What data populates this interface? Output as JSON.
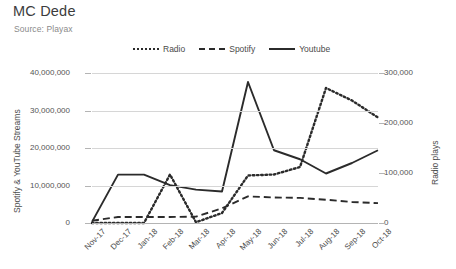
{
  "header": {
    "title": "MC Dede",
    "subtitle": "Source: Playax"
  },
  "chart_data": {
    "type": "line",
    "title": "MC Dede",
    "subtitle": "Source: Playax",
    "xlabel": "",
    "ylabel": "Spotify & YouTube Streams",
    "y2label": "Radio plays",
    "grid": true,
    "legend_position": "top-center",
    "categories": [
      "Nov-17",
      "Dec-17",
      "Jan-18",
      "Feb-18",
      "Mar-18",
      "Apr-18",
      "May-18",
      "Jun-18",
      "Jul-18",
      "Aug-18",
      "Sep-18",
      "Oct-18"
    ],
    "ylim": [
      0,
      40000000
    ],
    "yticks": [
      "0",
      "10,000,000",
      "20,000,000",
      "30,000,000",
      "40,000,000"
    ],
    "ytick_values": [
      0,
      10000000,
      20000000,
      30000000,
      40000000
    ],
    "y2lim": [
      0,
      300000
    ],
    "y2ticks": [
      "0",
      "100,000",
      "200,000",
      "300,000"
    ],
    "y2tick_values": [
      0,
      100000,
      200000,
      300000
    ],
    "series": [
      {
        "name": "Radio",
        "axis": "right",
        "style": "dotted",
        "color": "#2b2b2b",
        "values": [
          0,
          0,
          0,
          97000,
          1500,
          20000,
          95000,
          97000,
          112000,
          270000,
          245000,
          211000
        ]
      },
      {
        "name": "Spotify",
        "axis": "left",
        "style": "dashed",
        "color": "#2b2b2b",
        "values": [
          600000,
          1600000,
          1600000,
          1600000,
          1700000,
          3900000,
          7100000,
          6800000,
          6700000,
          6200000,
          5600000,
          5300000
        ]
      },
      {
        "name": "Youtube",
        "axis": "left",
        "style": "solid",
        "color": "#2b2b2b",
        "values": [
          300000,
          12900000,
          12900000,
          10100000,
          8900000,
          8400000,
          37600000,
          19400000,
          17000000,
          13200000,
          16000000,
          19400000
        ]
      }
    ]
  }
}
